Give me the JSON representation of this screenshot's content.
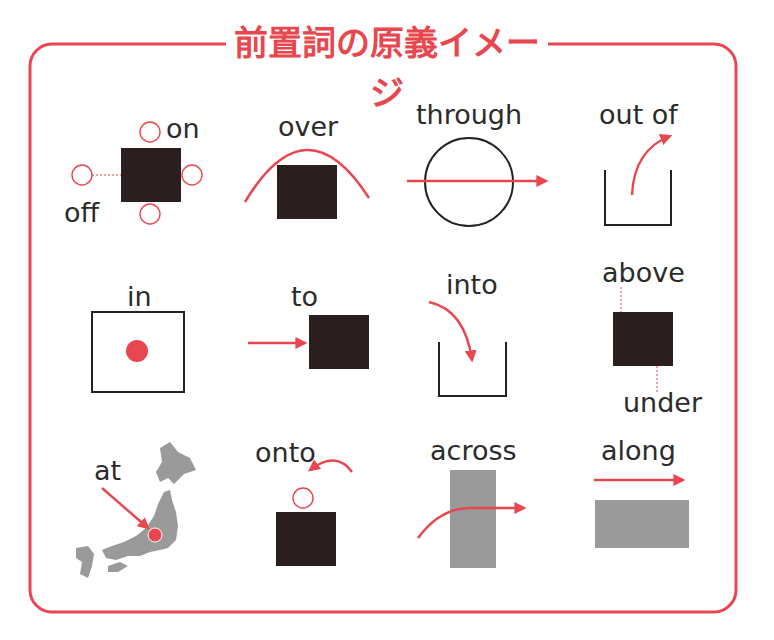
{
  "title": "前置詞の原義イメージ",
  "colors": {
    "accent_red": "#e8474f",
    "object_dark": "#2a1f1e",
    "object_gray": "#9a9a9a",
    "text": "#2b2b2b",
    "frame": "#e8474f"
  },
  "prepositions": [
    {
      "id": "on",
      "label": "on",
      "row": 1,
      "col": 1
    },
    {
      "id": "off",
      "label": "off",
      "row": 1,
      "col": 1
    },
    {
      "id": "over",
      "label": "over",
      "row": 1,
      "col": 2
    },
    {
      "id": "through",
      "label": "through",
      "row": 1,
      "col": 3
    },
    {
      "id": "out_of",
      "label": "out of",
      "row": 1,
      "col": 4
    },
    {
      "id": "in",
      "label": "in",
      "row": 2,
      "col": 1
    },
    {
      "id": "to",
      "label": "to",
      "row": 2,
      "col": 2
    },
    {
      "id": "into",
      "label": "into",
      "row": 2,
      "col": 3
    },
    {
      "id": "above",
      "label": "above",
      "row": 2,
      "col": 4
    },
    {
      "id": "under",
      "label": "under",
      "row": 2,
      "col": 4
    },
    {
      "id": "at",
      "label": "at",
      "row": 3,
      "col": 1
    },
    {
      "id": "onto",
      "label": "onto",
      "row": 3,
      "col": 2
    },
    {
      "id": "across",
      "label": "across",
      "row": 3,
      "col": 3
    },
    {
      "id": "along",
      "label": "along",
      "row": 3,
      "col": 4
    }
  ],
  "labels": {
    "on": "on",
    "off": "off",
    "over": "over",
    "through": "through",
    "out_of": "out of",
    "in": "in",
    "to": "to",
    "into": "into",
    "above": "above",
    "under": "under",
    "at": "at",
    "onto": "onto",
    "across": "across",
    "along": "along"
  }
}
